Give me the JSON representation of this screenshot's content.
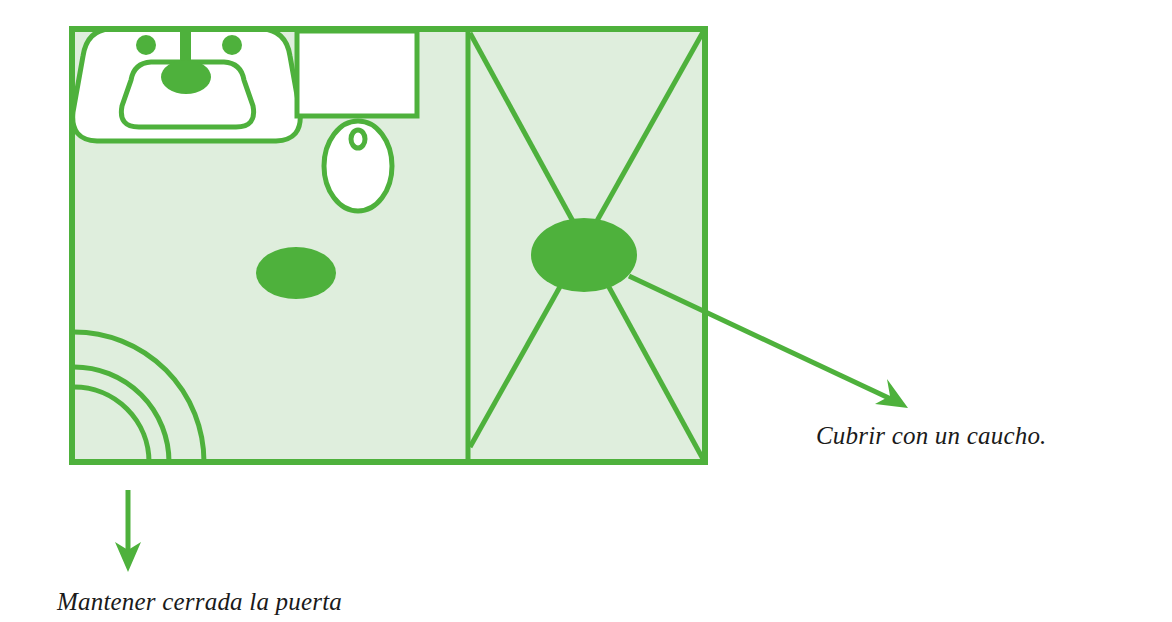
{
  "figure": {
    "kind": "line-drawing-floorplan"
  },
  "colors": {
    "line_green": "#4eb13c",
    "fill_mint": "#dfeedd",
    "fixture_white": "#ffffff",
    "text_black": "#1a1a1a",
    "page_background": "#ffffff"
  },
  "annotations": [
    {
      "id": "door",
      "text": "Mantener cerrada la puerta",
      "arrow": "down-arrow",
      "points_to": "door-swing-arcs"
    },
    {
      "id": "drain",
      "text": "Cubrir con un caucho.",
      "arrow": "diagonal-arrow",
      "points_to": "shower-drain"
    }
  ],
  "fixtures": [
    {
      "id": "sink",
      "label": "sink"
    },
    {
      "id": "toilet",
      "label": "toilet"
    },
    {
      "id": "floor-drain",
      "label": "floor drain"
    },
    {
      "id": "shower-stall",
      "label": "shower stall"
    },
    {
      "id": "shower-drain",
      "label": "shower drain"
    },
    {
      "id": "door-swing-arcs",
      "label": "door swing arcs"
    }
  ],
  "room": {
    "outline": "rectangle",
    "label": "bathroom"
  }
}
